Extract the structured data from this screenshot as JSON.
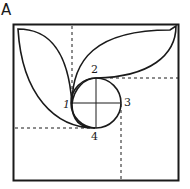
{
  "figure": {
    "title": "A",
    "labels": [
      {
        "text": "1",
        "x": 63,
        "y": 108
      },
      {
        "text": "2",
        "x": 93,
        "y": 72
      },
      {
        "text": "3",
        "x": 124,
        "y": 106
      },
      {
        "text": "4",
        "x": 92,
        "y": 140
      }
    ],
    "colors": {
      "stroke": "#1a1a1a",
      "background": "#ffffff"
    }
  }
}
